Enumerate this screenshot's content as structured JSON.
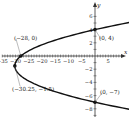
{
  "chart_data": {
    "type": "line",
    "title": "",
    "xlabel": "x",
    "ylabel": "y",
    "xlim": [
      -37,
      10
    ],
    "ylim": [
      -9,
      7
    ],
    "x_ticks": [
      -35,
      -30,
      -25,
      -20,
      -15,
      -10,
      -5,
      5
    ],
    "x_tick_labels": [
      "−35",
      "−30",
      "−25",
      "−20",
      "−15",
      "−10",
      "−5",
      "5"
    ],
    "y_ticks": [
      6,
      4,
      2,
      -2,
      -4,
      -6,
      -8
    ],
    "y_tick_labels": [
      "6",
      "4",
      "2",
      "−2",
      "−4",
      "−6",
      "−8"
    ],
    "grid": false,
    "series": [
      {
        "name": "parabola x = y^2 + 3y - 28",
        "curve": "sideways parabola opening right",
        "equation": "x = (y + 1.5)^2 - 30.25",
        "y_range": [
          -8.2,
          5.2
        ]
      }
    ],
    "points": [
      {
        "label": "(−28, 0)",
        "x": -28,
        "y": 0
      },
      {
        "label": "(0, 4)",
        "x": 0,
        "y": 4
      },
      {
        "label": "(−30.25, −1.5)",
        "x": -30.25,
        "y": -1.5
      },
      {
        "label": "(0, −7)",
        "x": 0,
        "y": -7
      }
    ],
    "axis_labels": {
      "x": "x",
      "y": "y"
    }
  }
}
